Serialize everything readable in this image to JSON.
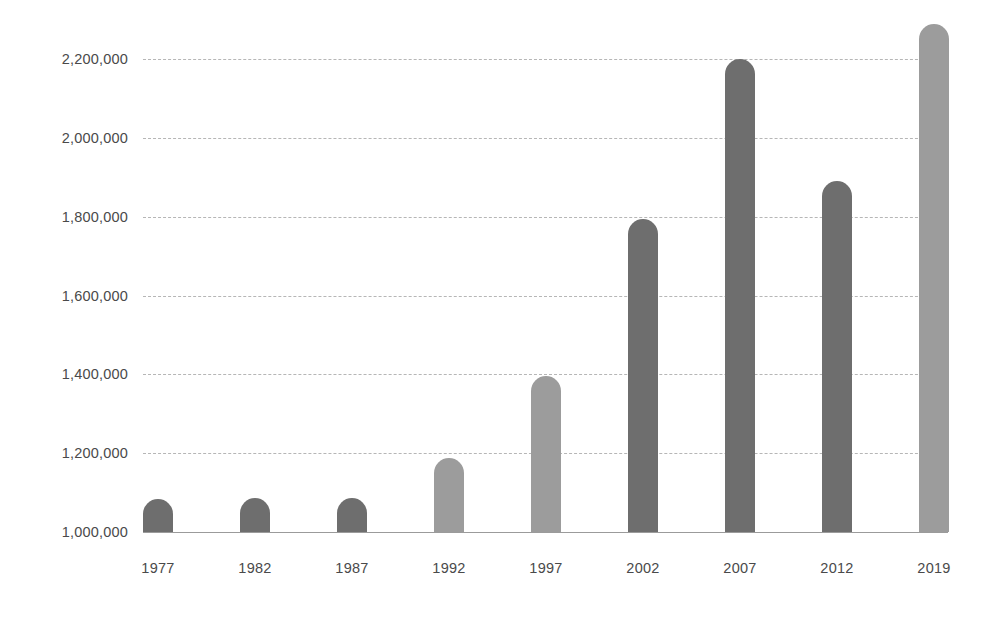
{
  "chart_data": {
    "type": "bar",
    "title": "",
    "subtitle": "",
    "xlabel": "",
    "ylabel": "",
    "categories": [
      "1977",
      "1982",
      "1987",
      "1992",
      "1997",
      "2002",
      "2007",
      "2012",
      "2019"
    ],
    "values": [
      1085000,
      1087000,
      1086000,
      1187000,
      1395000,
      1795000,
      2200000,
      1890000,
      2290000
    ],
    "ylim": [
      1000000,
      2300000
    ],
    "ytick_values": [
      1000000,
      1200000,
      1400000,
      1600000,
      1800000,
      2000000,
      2200000
    ],
    "ytick_labels": [
      "1,000,000",
      "1,200,000",
      "1,400,000",
      "1,600,000",
      "1,800,000",
      "2,000,000",
      "2,200,000"
    ],
    "grid": true,
    "gridline_style": "dashed",
    "legend": [],
    "legend_position": "none",
    "annotations": [],
    "bar_colors": [
      "#6e6e6e",
      "#6e6e6e",
      "#6e6e6e",
      "#9c9c9c",
      "#9c9c9c",
      "#6e6e6e",
      "#6e6e6e",
      "#6e6e6e",
      "#9c9c9c"
    ]
  },
  "style": {
    "background": "#ffffff",
    "grid_color": "#b6b6b6",
    "axis_color": "#9b9b9b",
    "tick_text_color": "#4a4a4a",
    "bar_dark": "#6e6e6e",
    "bar_light": "#9c9c9c"
  }
}
